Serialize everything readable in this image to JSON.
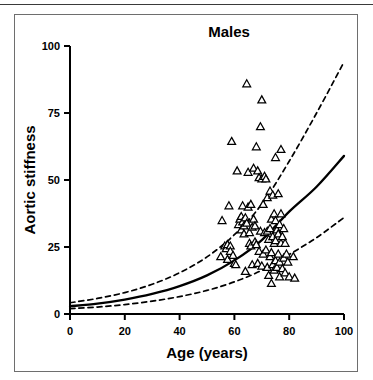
{
  "figure": {
    "title": "Males",
    "frame_color": "#6e6e6e",
    "rule_color": "#3a3a3a",
    "background": "#ffffff",
    "ink_color": "#000000"
  },
  "chart_data": {
    "type": "scatter",
    "title": "Males",
    "xlabel": "Age (years)",
    "ylabel": "Aortic stiffness",
    "xlim": [
      0,
      100
    ],
    "ylim": [
      0,
      100
    ],
    "xticks": [
      0,
      20,
      40,
      60,
      80,
      100
    ],
    "yticks": [
      0,
      25,
      50,
      75,
      100
    ],
    "xtick_labels": [
      "0",
      "20",
      "40",
      "60",
      "80",
      "100"
    ],
    "ytick_labels": [
      "0",
      "25",
      "50",
      "75",
      "100"
    ],
    "grid": false,
    "legend": "none",
    "marker": "open-triangle",
    "marker_size": 6,
    "series": [
      {
        "name": "Males observations",
        "kind": "scatter",
        "marker": "open-triangle",
        "points": [
          [
            55.0,
            21.5
          ],
          [
            55.5,
            35.0
          ],
          [
            56.5,
            25.5
          ],
          [
            57.0,
            24.5
          ],
          [
            57.5,
            26.0
          ],
          [
            57.5,
            20.5
          ],
          [
            58.0,
            40.5
          ],
          [
            58.5,
            25.5
          ],
          [
            58.5,
            23.5
          ],
          [
            59.0,
            64.5
          ],
          [
            59.5,
            22.0
          ],
          [
            60.0,
            19.0
          ],
          [
            60.5,
            18.5
          ],
          [
            61.0,
            53.5
          ],
          [
            61.5,
            33.5
          ],
          [
            62.0,
            35.5
          ],
          [
            62.5,
            36.5
          ],
          [
            62.5,
            31.5
          ],
          [
            63.0,
            40.5
          ],
          [
            63.0,
            34.5
          ],
          [
            63.5,
            33.0
          ],
          [
            63.5,
            30.0
          ],
          [
            64.0,
            36.0
          ],
          [
            64.0,
            16.0
          ],
          [
            64.5,
            86.0
          ],
          [
            64.5,
            34.0
          ],
          [
            65.0,
            53.0
          ],
          [
            65.0,
            40.0
          ],
          [
            65.5,
            30.5
          ],
          [
            65.5,
            26.5
          ],
          [
            66.0,
            41.0
          ],
          [
            66.0,
            25.5
          ],
          [
            66.5,
            32.5
          ],
          [
            66.5,
            18.5
          ],
          [
            67.0,
            54.5
          ],
          [
            67.0,
            35.5
          ],
          [
            67.5,
            33.0
          ],
          [
            67.5,
            27.0
          ],
          [
            68.0,
            62.5
          ],
          [
            68.0,
            26.0
          ],
          [
            68.5,
            53.5
          ],
          [
            68.5,
            19.0
          ],
          [
            69.0,
            51.0
          ],
          [
            69.0,
            23.5
          ],
          [
            69.5,
            70.0
          ],
          [
            69.5,
            31.0
          ],
          [
            70.0,
            80.0
          ],
          [
            70.0,
            50.5
          ],
          [
            70.0,
            18.0
          ],
          [
            70.5,
            41.0
          ],
          [
            70.5,
            22.5
          ],
          [
            71.0,
            51.5
          ],
          [
            71.0,
            30.5
          ],
          [
            71.5,
            50.5
          ],
          [
            71.5,
            24.0
          ],
          [
            72.0,
            43.5
          ],
          [
            72.0,
            31.0
          ],
          [
            72.0,
            17.5
          ],
          [
            72.5,
            28.0
          ],
          [
            72.5,
            14.5
          ],
          [
            73.0,
            46.0
          ],
          [
            73.0,
            32.0
          ],
          [
            73.0,
            21.5
          ],
          [
            73.5,
            35.5
          ],
          [
            73.5,
            23.0
          ],
          [
            73.5,
            11.5
          ],
          [
            74.0,
            44.5
          ],
          [
            74.0,
            29.0
          ],
          [
            74.0,
            18.5
          ],
          [
            74.5,
            37.5
          ],
          [
            74.5,
            26.5
          ],
          [
            74.5,
            16.5
          ],
          [
            75.0,
            58.5
          ],
          [
            75.0,
            35.0
          ],
          [
            75.0,
            27.5
          ],
          [
            75.0,
            20.0
          ],
          [
            75.5,
            31.5
          ],
          [
            75.5,
            17.5
          ],
          [
            76.0,
            45.0
          ],
          [
            76.0,
            30.0
          ],
          [
            76.0,
            22.5
          ],
          [
            76.5,
            33.5
          ],
          [
            76.5,
            19.5
          ],
          [
            76.5,
            14.0
          ],
          [
            77.0,
            61.5
          ],
          [
            77.0,
            37.5
          ],
          [
            77.0,
            26.5
          ],
          [
            77.5,
            29.0
          ],
          [
            77.5,
            17.0
          ],
          [
            78.0,
            32.0
          ],
          [
            78.0,
            21.0
          ],
          [
            78.5,
            26.5
          ],
          [
            78.5,
            15.5
          ],
          [
            79.0,
            22.5
          ],
          [
            79.5,
            19.5
          ],
          [
            80.0,
            14.0
          ],
          [
            81.5,
            21.5
          ],
          [
            82.0,
            13.5
          ]
        ]
      },
      {
        "name": "Regression (mean)",
        "kind": "line",
        "style": "solid",
        "points": [
          [
            0,
            2.9
          ],
          [
            10,
            3.9
          ],
          [
            20,
            5.4
          ],
          [
            30,
            7.5
          ],
          [
            40,
            10.4
          ],
          [
            50,
            14.4
          ],
          [
            60,
            20.0
          ],
          [
            70,
            27.6
          ],
          [
            80,
            38.2
          ],
          [
            90,
            47.5
          ],
          [
            100,
            59.0
          ]
        ]
      },
      {
        "name": "Upper confidence band",
        "kind": "line",
        "style": "dashed",
        "points": [
          [
            0,
            4.2
          ],
          [
            10,
            5.8
          ],
          [
            20,
            8.0
          ],
          [
            30,
            11.1
          ],
          [
            40,
            15.4
          ],
          [
            50,
            21.3
          ],
          [
            60,
            29.6
          ],
          [
            70,
            41.0
          ],
          [
            80,
            57.0
          ],
          [
            90,
            75.0
          ],
          [
            100,
            94.0
          ]
        ]
      },
      {
        "name": "Lower confidence band",
        "kind": "line",
        "style": "dashed",
        "points": [
          [
            0,
            2.0
          ],
          [
            10,
            2.6
          ],
          [
            20,
            3.5
          ],
          [
            30,
            4.8
          ],
          [
            40,
            6.5
          ],
          [
            50,
            8.8
          ],
          [
            60,
            12.0
          ],
          [
            70,
            16.3
          ],
          [
            80,
            22.2
          ],
          [
            90,
            28.5
          ],
          [
            100,
            36.0
          ]
        ]
      }
    ]
  }
}
